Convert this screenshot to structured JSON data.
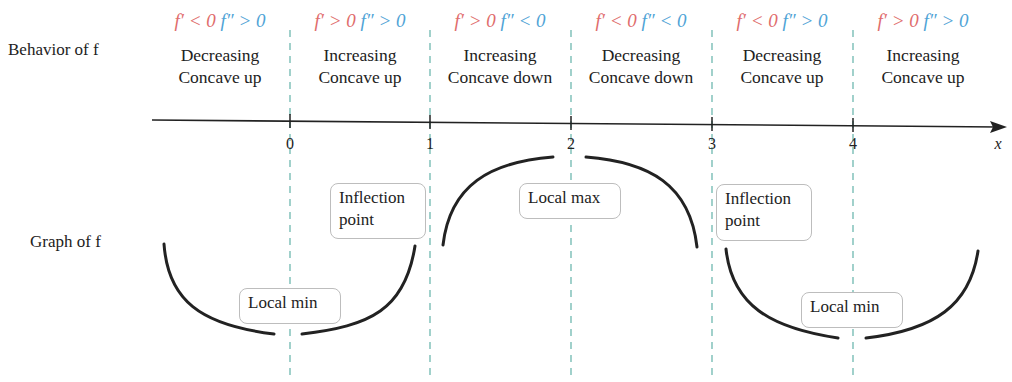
{
  "row_labels": {
    "behavior": "Behavior of f",
    "graph": "Graph of f"
  },
  "colors": {
    "first_derivative": "#e06c6c",
    "second_derivative": "#4fa3d6",
    "dashed_lines": "#6fb8b0",
    "curve": "#222222"
  },
  "intervals": [
    {
      "fp": "f′ < 0",
      "fpp": "f″ > 0",
      "line1": "Decreasing",
      "line2": "Concave up"
    },
    {
      "fp": "f′ > 0",
      "fpp": "f″ > 0",
      "line1": "Increasing",
      "line2": "Concave up"
    },
    {
      "fp": "f′ > 0",
      "fpp": "f″ < 0",
      "line1": "Increasing",
      "line2": "Concave down"
    },
    {
      "fp": "f′ < 0",
      "fpp": "f″ < 0",
      "line1": "Decreasing",
      "line2": "Concave down"
    },
    {
      "fp": "f′ < 0",
      "fpp": "f″ > 0",
      "line1": "Decreasing",
      "line2": "Concave up"
    },
    {
      "fp": "f′ > 0",
      "fpp": "f″ > 0",
      "line1": "Increasing",
      "line2": "Concave up"
    }
  ],
  "axis": {
    "ticks": [
      "0",
      "1",
      "2",
      "3",
      "4"
    ],
    "label": "x"
  },
  "annotations": {
    "local_min_1": "Local min",
    "inflection_1_line1": "Inflection",
    "inflection_1_line2": "point",
    "local_max": "Local max",
    "inflection_2_line1": "Inflection",
    "inflection_2_line2": "point",
    "local_min_2": "Local min"
  }
}
